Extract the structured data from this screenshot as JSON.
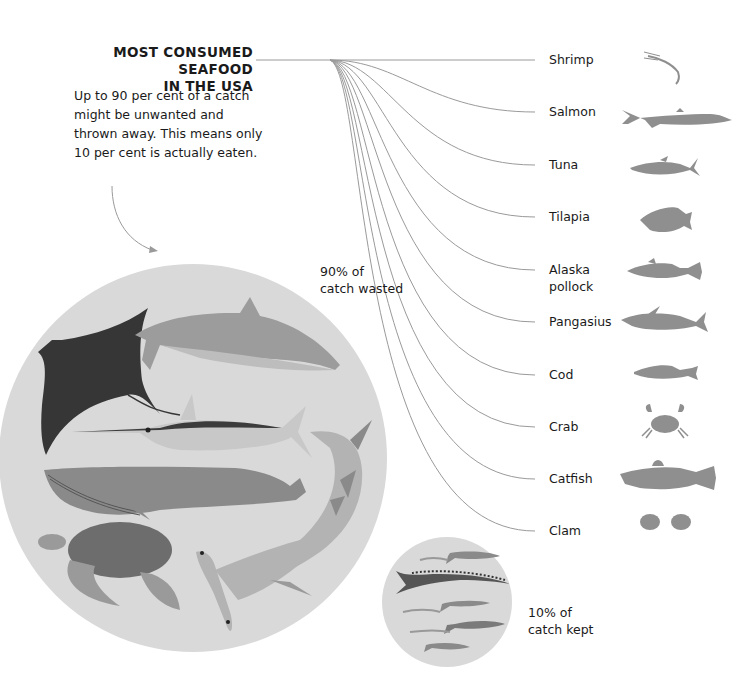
{
  "title": {
    "lines": [
      "MOST CONSUMED",
      "SEAFOOD",
      "IN THE USA"
    ]
  },
  "description": {
    "lines": [
      "Up to 90 per cent of a catch",
      "might be unwanted and",
      "thrown away. This means only",
      "10 per cent is actually eaten."
    ]
  },
  "wasted": {
    "lines": [
      "90% of",
      "catch wasted"
    ],
    "percent": 90,
    "animals": [
      "manta-ray",
      "dolphin",
      "swordfish",
      "whale",
      "shark",
      "sea-turtle",
      "hammerhead-shark"
    ]
  },
  "kept": {
    "lines": [
      "10% of",
      "catch kept"
    ],
    "percent": 10,
    "animals": [
      "barracuda",
      "mackerel",
      "shrimp",
      "sardine"
    ]
  },
  "seafood": [
    {
      "label": "Shrimp",
      "icon": "shrimp-icon",
      "y": 60
    },
    {
      "label": "Salmon",
      "icon": "salmon-icon",
      "y": 112
    },
    {
      "label": "Tuna",
      "icon": "tuna-icon",
      "y": 165
    },
    {
      "label": "Tilapia",
      "icon": "tilapia-icon",
      "y": 217
    },
    {
      "label": "Alaska\npollock",
      "label_lines": [
        "Alaska",
        "pollock"
      ],
      "icon": "pollock-icon",
      "y": 270
    },
    {
      "label": "Pangasius",
      "icon": "pangasius-icon",
      "y": 322
    },
    {
      "label": "Cod",
      "icon": "cod-icon",
      "y": 375
    },
    {
      "label": "Crab",
      "icon": "crab-icon",
      "y": 427
    },
    {
      "label": "Catfish",
      "icon": "catfish-icon",
      "y": 479
    },
    {
      "label": "Clam",
      "icon": "clam-icon",
      "y": 531
    }
  ],
  "colors": {
    "text": "#1a1a1a",
    "line": "#9a9a9a",
    "circle_bg": "#d9d9d9",
    "icon_gray": "#8f8f8f",
    "dark": "#3a3a3a"
  }
}
